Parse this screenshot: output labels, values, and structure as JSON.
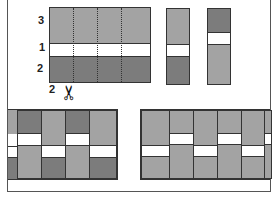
{
  "colors": {
    "light": "#a3a3a3",
    "dark": "#7c7c7c",
    "white": "#ffffff",
    "line": "#333333"
  },
  "labels": {
    "strip3": "3",
    "strip1": "1",
    "strip2": "2",
    "cut_width": "2"
  },
  "icons": {
    "scissors": "✂"
  }
}
